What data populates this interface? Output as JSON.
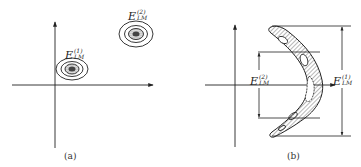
{
  "figure": {
    "panels": [
      {
        "id": "a",
        "caption": "(a)",
        "labels": [
          {
            "base": "E",
            "superscript": "(1)",
            "subscript": "LM"
          },
          {
            "base": "E",
            "superscript": "(2)",
            "subscript": "LM"
          }
        ],
        "description": "Two separated clusters, each shown as concentric elliptical contours with a hatched core, in the first quadrant of a 2D axis system"
      },
      {
        "id": "b",
        "caption": "(b)",
        "labels": [
          {
            "base": "E",
            "superscript": "(2)",
            "subscript": "LM"
          },
          {
            "base": "E",
            "superscript": "(1)",
            "subscript": "LM"
          }
        ],
        "description": "A single boomerang/crescent-shaped hatched region with inner contours; dimension brackets mark E(2)LM (inner extent) on the left and E(1)LM (full extent) on the right"
      }
    ],
    "colors": {
      "ink": "#222222",
      "background": "#ffffff"
    }
  }
}
